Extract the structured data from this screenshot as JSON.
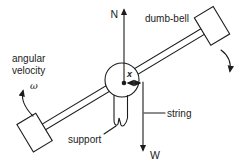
{
  "figure": {
    "colors": {
      "ink": "#1c1c1c",
      "background": "#ffffff"
    },
    "labels": {
      "north": "N",
      "weight": "W",
      "dumbbell": "dumb-bell",
      "angular_velocity_line1": "angular",
      "angular_velocity_line2": "velocity",
      "omega": "ω",
      "radius": "x",
      "string": "string",
      "support": "support"
    }
  }
}
